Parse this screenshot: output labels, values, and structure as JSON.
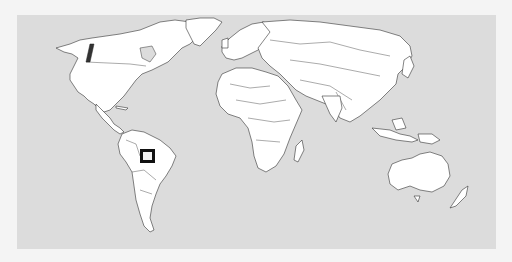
{
  "map": {
    "type": "world-political-outline",
    "projection": "equirectangular-like",
    "colors": {
      "ocean": "#dcdcdc",
      "land": "#ffffff",
      "border": "#333333",
      "page_background": "#f4f4f4",
      "marker_stroke": "#111111"
    },
    "marker": {
      "shape": "square",
      "region": "Northern Brazil (Amazon basin)",
      "x": 140,
      "y": 149,
      "width": 15,
      "height": 14
    }
  }
}
